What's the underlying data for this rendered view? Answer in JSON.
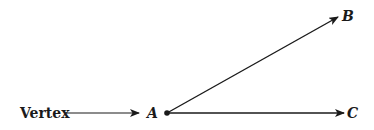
{
  "diagram": {
    "type": "angle",
    "labels": {
      "vertex_caption": "Vertex",
      "vertex_point": "A",
      "ray_end_upper": "B",
      "ray_end_lower": "C"
    },
    "colors": {
      "ink": "#1a1a1a",
      "background": "#ffffff"
    }
  }
}
